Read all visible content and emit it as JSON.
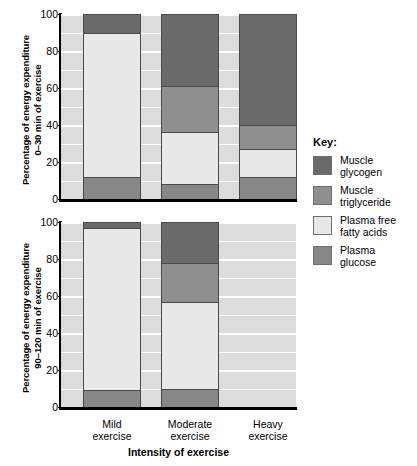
{
  "chart_data": {
    "type": "bar",
    "subtype": "stacked-bar",
    "title": "",
    "xlabel": "Intensity of exercise",
    "categories": [
      "Mild exercise",
      "Moderate exercise",
      "Heavy exercise"
    ],
    "ylim": [
      0,
      100
    ],
    "yticks": [
      0,
      20,
      40,
      60,
      80,
      100
    ],
    "grid": true,
    "legend": {
      "title": "Key:",
      "position": "right",
      "entries": [
        {
          "name": "Muscle glycogen",
          "color": "#6a6a6a"
        },
        {
          "name": "Muscle triglyceride",
          "color": "#8f8f8f"
        },
        {
          "name": "Plasma free fatty acids",
          "color": "#e8e8e8"
        },
        {
          "name": "Plasma glucose",
          "color": "#878787"
        }
      ]
    },
    "panels": [
      {
        "id": "top",
        "ylabel": "Percentage of energy expenditure\n0–30 min of exercise",
        "series": [
          {
            "name": "Plasma glucose",
            "color": "#878787",
            "values": [
              12,
              8,
              12
            ]
          },
          {
            "name": "Plasma free fatty acids",
            "color": "#e8e8e8",
            "values": [
              78,
              28,
              15
            ]
          },
          {
            "name": "Muscle triglyceride",
            "color": "#8f8f8f",
            "values": [
              0,
              25,
              13
            ]
          },
          {
            "name": "Muscle glycogen",
            "color": "#6a6a6a",
            "values": [
              10,
              39,
              60
            ]
          }
        ],
        "cumulative_tops": {
          "Mild exercise": {
            "Plasma glucose": 12,
            "Plasma free fatty acids": 90,
            "Muscle triglyceride": 90,
            "Muscle glycogen": 100
          },
          "Moderate exercise": {
            "Plasma glucose": 8,
            "Plasma free fatty acids": 36,
            "Muscle triglyceride": 61,
            "Muscle glycogen": 100
          },
          "Heavy exercise": {
            "Plasma glucose": 12,
            "Plasma free fatty acids": 27,
            "Muscle triglyceride": 40,
            "Muscle glycogen": 100
          }
        }
      },
      {
        "id": "bottom",
        "ylabel": "Percentage of energy expenditure\n90–120 min of exercise",
        "series": [
          {
            "name": "Plasma glucose",
            "color": "#878787",
            "values": [
              9,
              10,
              null
            ]
          },
          {
            "name": "Plasma free fatty acids",
            "color": "#e8e8e8",
            "values": [
              88,
              47,
              null
            ]
          },
          {
            "name": "Muscle triglyceride",
            "color": "#8f8f8f",
            "values": [
              0,
              21,
              null
            ]
          },
          {
            "name": "Muscle glycogen",
            "color": "#6a6a6a",
            "values": [
              3,
              22,
              null
            ]
          }
        ],
        "cumulative_tops": {
          "Mild exercise": {
            "Plasma glucose": 9,
            "Plasma free fatty acids": 97,
            "Muscle triglyceride": 97,
            "Muscle glycogen": 100
          },
          "Moderate exercise": {
            "Plasma glucose": 10,
            "Plasma free fatty acids": 57,
            "Muscle triglyceride": 78,
            "Muscle glycogen": 100
          },
          "Heavy exercise": null
        }
      }
    ],
    "colors": {
      "plot_background": "#dcdcdc",
      "gridline": "#ffffff",
      "axis": "#000000",
      "segment_border": "#4a4a4a"
    }
  },
  "axis": {
    "ticks": [
      "100",
      "80",
      "60",
      "40",
      "20",
      "0"
    ],
    "xtitle": "Intensity of exercise",
    "xlabels": [
      "Mild\nexercise",
      "Moderate\nexercise",
      "Heavy\nexercise"
    ]
  },
  "panel_top": {
    "ylabel": "Percentage of energy expenditure\n0–30 min of exercise"
  },
  "panel_bottom": {
    "ylabel": "Percentage of energy expenditure\n90–120 min of exercise"
  },
  "key": {
    "title": "Key:",
    "items": [
      {
        "label": "Muscle\nglycogen",
        "color": "#6a6a6a"
      },
      {
        "label": "Muscle\ntriglyceride",
        "color": "#8f8f8f"
      },
      {
        "label": "Plasma free\nfatty acids",
        "color": "#e8e8e8"
      },
      {
        "label": "Plasma\nglucose",
        "color": "#878787"
      }
    ]
  }
}
